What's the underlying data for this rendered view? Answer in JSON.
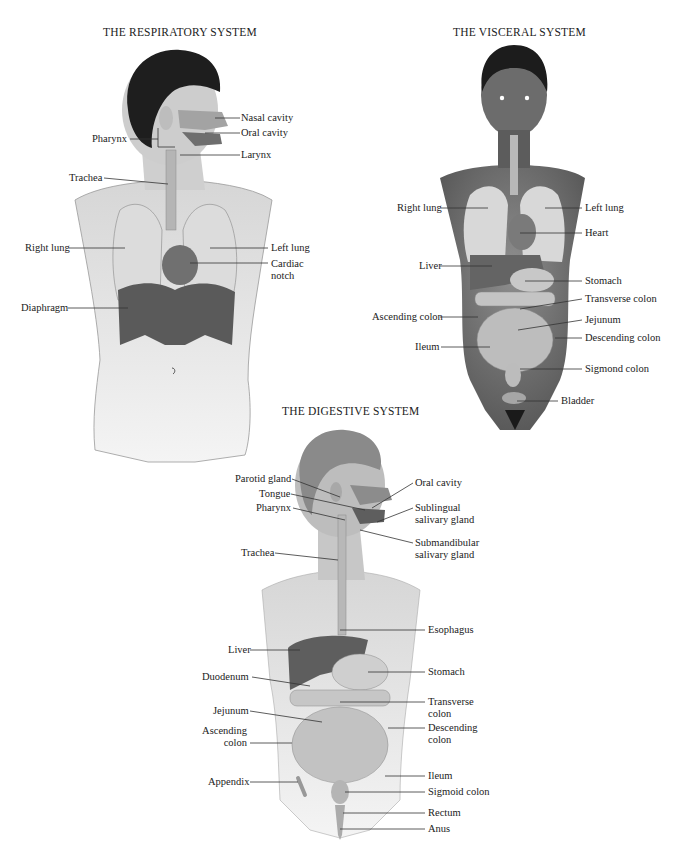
{
  "respiratory": {
    "title": "THE RESPIRATORY SYSTEM",
    "labels": {
      "nasal_cavity": "Nasal cavity",
      "oral_cavity": "Oral cavity",
      "pharynx": "Pharynx",
      "larynx": "Larynx",
      "trachea": "Trachea",
      "right_lung": "Right lung",
      "left_lung": "Left lung",
      "cardiac_notch_1": "Cardiac",
      "cardiac_notch_2": "notch",
      "diaphragm": "Diaphragm"
    }
  },
  "visceral": {
    "title": "THE VISCERAL SYSTEM",
    "labels": {
      "right_lung": "Right lung",
      "left_lung": "Left lung",
      "heart": "Heart",
      "liver": "Liver",
      "stomach": "Stomach",
      "transverse_colon": "Transverse colon",
      "ascending_colon": "Ascending colon",
      "jejunum": "Jejunum",
      "descending_colon": "Descending colon",
      "ileum": "Ileum",
      "sigmond_colon": "Sigmond colon",
      "bladder": "Bladder"
    }
  },
  "digestive": {
    "title": "THE DIGESTIVE SYSTEM",
    "labels": {
      "parotid_gland": "Parotid gland",
      "tongue": "Tongue",
      "pharynx": "Pharynx",
      "oral_cavity": "Oral cavity",
      "sublingual_1": "Sublingual",
      "sublingual_2": "salivary gland",
      "submandibular_1": "Submandibular",
      "submandibular_2": "salivary gland",
      "trachea": "Trachea",
      "esophagus": "Esophagus",
      "liver": "Liver",
      "stomach": "Stomach",
      "duodenum": "Duodenum",
      "transverse_colon_1": "Transverse",
      "transverse_colon_2": "colon",
      "jejunum": "Jejunum",
      "descending_colon_1": "Descending",
      "descending_colon_2": "colon",
      "ascending_colon_1": "Ascending",
      "ascending_colon_2": "colon",
      "appendix": "Appendix",
      "ileum": "Ileum",
      "sigmoid_colon": "Sigmoid colon",
      "rectum": "Rectum",
      "anus": "Anus"
    }
  }
}
